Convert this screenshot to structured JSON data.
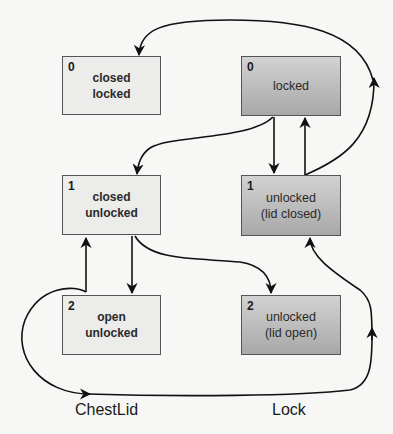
{
  "machines": [
    {
      "name": "ChestLid",
      "states": [
        {
          "index": "0",
          "line1": "closed",
          "line2": "locked"
        },
        {
          "index": "1",
          "line1": "closed",
          "line2": "unlocked"
        },
        {
          "index": "2",
          "line1": "open",
          "line2": "unlocked"
        }
      ]
    },
    {
      "name": "Lock",
      "states": [
        {
          "index": "0",
          "line1": "locked",
          "line2": ""
        },
        {
          "index": "1",
          "line1": "unlocked",
          "line2": "(lid closed)"
        },
        {
          "index": "2",
          "line1": "unlocked",
          "line2": "(lid open)"
        }
      ]
    }
  ],
  "transitions": [
    {
      "from": "Lock.0",
      "to": "ChestLid.0"
    },
    {
      "from": "Lock.0",
      "to": "ChestLid.1"
    },
    {
      "from": "Lock.0",
      "to": "Lock.1"
    },
    {
      "from": "Lock.1",
      "to": "Lock.0"
    },
    {
      "from": "Lock.1",
      "to": "Lock.0 (outer loop)"
    },
    {
      "from": "ChestLid.1",
      "to": "ChestLid.2"
    },
    {
      "from": "ChestLid.1",
      "to": "Lock.2"
    },
    {
      "from": "ChestLid.2",
      "to": "ChestLid.1"
    },
    {
      "from": "ChestLid.2",
      "to": "Lock.1 (bottom loop)"
    }
  ],
  "colors": {
    "light_state": "#ececea",
    "dark_state_top": "#d2d2d2",
    "dark_state_bottom": "#a8a8a8",
    "border": "#555555",
    "edge": "#111111"
  }
}
